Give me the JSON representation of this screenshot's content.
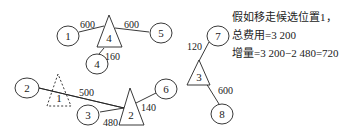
{
  "diagram": {
    "circles": [
      {
        "id": "c1",
        "label": "1",
        "cx": 68,
        "cy": 36
      },
      {
        "id": "c5",
        "label": "5",
        "cx": 161,
        "cy": 33
      },
      {
        "id": "c4",
        "label": "4",
        "cx": 97,
        "cy": 64
      },
      {
        "id": "c2",
        "label": "2",
        "cx": 27,
        "cy": 88
      },
      {
        "id": "c3",
        "label": "3",
        "cx": 88,
        "cy": 115
      },
      {
        "id": "c6",
        "label": "6",
        "cx": 166,
        "cy": 89
      },
      {
        "id": "c7",
        "label": "7",
        "cx": 218,
        "cy": 36
      },
      {
        "id": "c8",
        "label": "8",
        "cx": 222,
        "cy": 114
      }
    ],
    "triangles": [
      {
        "id": "t4",
        "label": "4",
        "dashed": false
      },
      {
        "id": "t1",
        "label": "1",
        "dashed": true
      },
      {
        "id": "t2",
        "label": "2",
        "dashed": false
      },
      {
        "id": "t3",
        "label": "3",
        "dashed": false
      }
    ],
    "edges": [
      {
        "from": "c1",
        "to": "t4",
        "weight": "600"
      },
      {
        "from": "t4",
        "to": "c5",
        "weight": "600"
      },
      {
        "from": "t4",
        "to": "c4",
        "weight": "160"
      },
      {
        "from": "c2",
        "to": "t2",
        "weight": "500"
      },
      {
        "from": "c3",
        "to": "t2",
        "weight": "480"
      },
      {
        "from": "t2",
        "to": "c6",
        "weight": "140"
      },
      {
        "from": "t3",
        "to": "c7",
        "weight": "120"
      },
      {
        "from": "t3",
        "to": "c8",
        "weight": "600"
      }
    ]
  },
  "notes": {
    "line1": "假如移走候选位置1，",
    "line2": "总费用=3 200",
    "line3": "增量=3 200−2 480=720"
  }
}
